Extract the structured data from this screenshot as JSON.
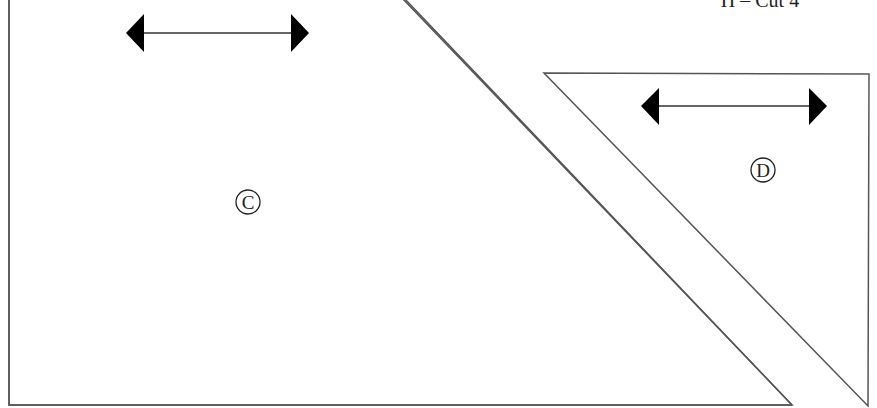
{
  "header": {
    "cut_label": "H – Cut 4"
  },
  "pieces": [
    {
      "id": "C",
      "label": "C",
      "shape": "right-triangle",
      "grainline": "horizontal-double-arrow"
    },
    {
      "id": "D",
      "label": "D",
      "shape": "right-triangle",
      "grainline": "horizontal-double-arrow"
    }
  ],
  "colors": {
    "line": "#555555",
    "arrow": "#000000",
    "background": "#ffffff"
  }
}
